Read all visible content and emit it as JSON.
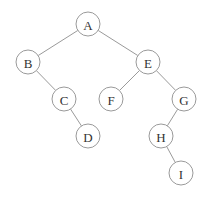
{
  "diagram": {
    "type": "binary-tree",
    "node_radius": 12,
    "nodes": [
      {
        "id": "A",
        "label": "A",
        "x": 88,
        "y": 24
      },
      {
        "id": "B",
        "label": "B",
        "x": 28,
        "y": 62
      },
      {
        "id": "E",
        "label": "E",
        "x": 148,
        "y": 62
      },
      {
        "id": "C",
        "label": "C",
        "x": 64,
        "y": 99
      },
      {
        "id": "F",
        "label": "F",
        "x": 111,
        "y": 99
      },
      {
        "id": "G",
        "label": "G",
        "x": 184,
        "y": 99
      },
      {
        "id": "D",
        "label": "D",
        "x": 88,
        "y": 136
      },
      {
        "id": "H",
        "label": "H",
        "x": 161,
        "y": 136
      },
      {
        "id": "I",
        "label": "I",
        "x": 181,
        "y": 173
      }
    ],
    "edges": [
      {
        "from": "A",
        "to": "B"
      },
      {
        "from": "A",
        "to": "E"
      },
      {
        "from": "B",
        "to": "C"
      },
      {
        "from": "C",
        "to": "D"
      },
      {
        "from": "E",
        "to": "F"
      },
      {
        "from": "E",
        "to": "G"
      },
      {
        "from": "G",
        "to": "H"
      },
      {
        "from": "H",
        "to": "I"
      }
    ]
  }
}
